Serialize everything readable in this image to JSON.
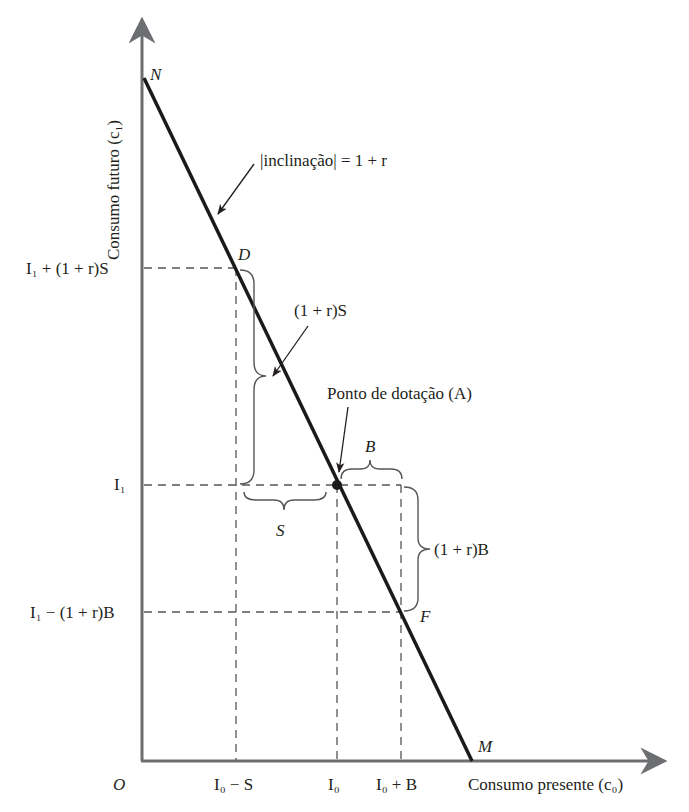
{
  "diagram": {
    "type": "intertemporal budget constraint",
    "axes": {
      "x_label": "Consumo presente (c₀)",
      "y_label": "Consumo futuro (c₁)",
      "origin_label": "O"
    },
    "points": {
      "N": "N",
      "D": "D",
      "A": "A",
      "F": "F",
      "M": "M"
    },
    "x_ticks": [
      "I₀ − S",
      "I₀",
      "I₀ + B"
    ],
    "y_ticks": [
      "I₁ + (1 + r)S",
      "I₁",
      "I₁ − (1 + r)B"
    ],
    "annotations": {
      "slope": "|inclinação| = 1 + r",
      "endowment": "Ponto de dotação (A)",
      "saving_gain": "(1 + r)S",
      "borrow_cost": "(1 + r)B",
      "saving": "S",
      "borrowing": "B"
    },
    "colors": {
      "line": "#1a1a1a",
      "axis": "#6d6e71",
      "dashes": "#555555",
      "text": "#231f20"
    }
  }
}
